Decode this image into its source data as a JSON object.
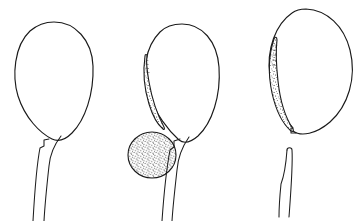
{
  "figure": {
    "background_color": "#ffffff",
    "ink_color": "#1a1a1a",
    "stipple_color": "#2a2a2a",
    "width": 364,
    "height": 221,
    "style": "scientific line drawing, pen-and-ink with stipple shading",
    "panel_count": 3,
    "panels": [
      {
        "id": "panel-left",
        "label": "",
        "description": "plain egg-shaped vesicle with two-line narrow stalk descending to bottom edge",
        "bounds": {
          "x": 10,
          "y": 18,
          "width": 90,
          "height": 203
        },
        "body": {
          "name": "egg-outline",
          "type": "egg",
          "center_x": 54,
          "center_y": 80,
          "radius_x": 39,
          "radius_y": 58,
          "stippled": false
        },
        "stalk": {
          "name": "stalk",
          "attached": true,
          "top_x": 46,
          "top_y": 138,
          "bottom_x": 36,
          "bottom_y": 221,
          "width_top": 12,
          "width_bottom": 9,
          "notch": true
        },
        "crescent": null,
        "sphere": null
      },
      {
        "id": "panel-middle",
        "label": "",
        "description": "egg-shaped vesicle with stippled crescent along left flank and a large stippled sphere at the base, stalk descending",
        "bounds": {
          "x": 125,
          "y": 20,
          "width": 105,
          "height": 201
        },
        "body": {
          "name": "egg-outline",
          "type": "egg",
          "center_x": 182,
          "center_y": 83,
          "radius_x": 37,
          "radius_y": 58,
          "stippled": false
        },
        "stalk": {
          "name": "stalk",
          "attached": true,
          "top_x": 180,
          "top_y": 139,
          "bottom_x": 166,
          "bottom_y": 221,
          "width_top": 11,
          "width_bottom": 9,
          "notch": true
        },
        "crescent": {
          "name": "stippled-crescent",
          "tip_x": 144,
          "tip_y": 56,
          "base_x": 162,
          "base_y": 128,
          "max_width": 11,
          "stippled": true
        },
        "sphere": {
          "name": "stippled-sphere",
          "center_x": 152,
          "center_y": 155,
          "radius_x": 24,
          "radius_y": 23,
          "stippled": true
        }
      },
      {
        "id": "panel-right",
        "label": "",
        "description": "tilted oval vesicle with stippled crescent along left flank, stalk detached and drawn separately below",
        "bounds": {
          "x": 262,
          "y": 8,
          "width": 92,
          "height": 213
        },
        "body": {
          "name": "oval-outline",
          "type": "tilted-oval",
          "center_x": 307,
          "center_y": 70,
          "radius_x": 44,
          "radius_y": 62,
          "rotation_deg": -18,
          "stippled": false
        },
        "stalk": {
          "name": "detached-stalk",
          "attached": false,
          "top_x": 289,
          "top_y": 147,
          "bottom_x": 280,
          "bottom_y": 217,
          "width_top": 7,
          "width_bottom": 7,
          "notch": false
        },
        "crescent": {
          "name": "stippled-crescent",
          "tip_x": 272,
          "tip_y": 40,
          "base_x": 294,
          "base_y": 128,
          "max_width": 14,
          "stippled": true
        },
        "sphere": null
      }
    ]
  }
}
